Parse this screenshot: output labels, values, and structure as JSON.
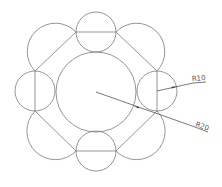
{
  "drawing": {
    "type": "cad-geometric-construction",
    "center_circle": {
      "cx": 96,
      "cy": 92,
      "r": 40
    },
    "small_circles": [
      {
        "name": "top",
        "cx": 96,
        "cy": 32,
        "r": 20
      },
      {
        "name": "right",
        "cx": 157,
        "cy": 91,
        "r": 20
      },
      {
        "name": "bottom",
        "cx": 96,
        "cy": 151,
        "r": 20
      },
      {
        "name": "left",
        "cx": 35,
        "cy": 91,
        "r": 20
      }
    ],
    "diagonal_circles": [
      {
        "name": "top-left",
        "cx": 55.5,
        "cy": 51.5,
        "r": 28
      },
      {
        "name": "top-right",
        "cx": 136.5,
        "cy": 51.5,
        "r": 28
      },
      {
        "name": "bottom-right",
        "cx": 136.5,
        "cy": 131,
        "r": 28
      },
      {
        "name": "bottom-left",
        "cx": 55.5,
        "cy": 131,
        "r": 28
      }
    ],
    "octagon_points": "76,32 116,32 157,71 157,111 116,151 76,151 35,111 35,71",
    "dimensions": {
      "r10": {
        "label": "R10"
      },
      "r20": {
        "label": "R20"
      }
    },
    "colors": {
      "line": "#7a7a7a",
      "dimension": "#555555",
      "background": "#ffffff"
    }
  }
}
